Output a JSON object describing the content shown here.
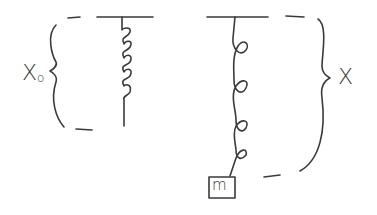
{
  "diagram": {
    "left_spring": {
      "label_main": "X",
      "label_sub": "o",
      "state": "unstretched"
    },
    "right_spring": {
      "label": "X",
      "state": "stretched with mass"
    },
    "mass": {
      "label": "m"
    },
    "colors": {
      "ink": "#3a3a3a",
      "background": "#ffffff"
    }
  }
}
